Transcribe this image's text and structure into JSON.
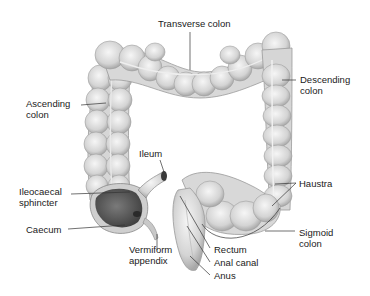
{
  "diagram": {
    "labels": {
      "transverse_colon": "Transverse colon",
      "descending_colon": [
        "Descending",
        "colon"
      ],
      "ascending_colon": [
        "Ascending",
        "colon"
      ],
      "ileum": "Ileum",
      "ileocaecal_sphincter": [
        "Ileocaecal",
        "sphincter"
      ],
      "haustra": "Haustra",
      "caecum": "Caecum",
      "sigmoid_colon": [
        "Sigmoid",
        "colon"
      ],
      "vermiform_appendix": [
        "Vermiform",
        "appendix"
      ],
      "rectum": "Rectum",
      "anal_canal": "Anal canal",
      "anus": "Anus"
    },
    "colors": {
      "tissue_light": "#e8e8e8",
      "tissue_mid": "#c8c8c8",
      "tissue_dark": "#8a8a8a",
      "caecum_interior": "#5a5a5a",
      "leader_line": "#333333",
      "text": "#1a1a1a"
    }
  }
}
